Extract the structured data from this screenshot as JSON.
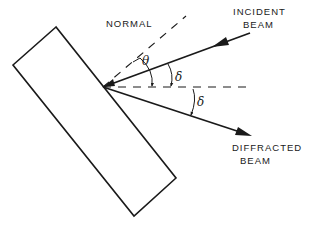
{
  "diagram": {
    "labels": {
      "normal": "NORMAL",
      "incident_line1": "INCIDENT",
      "incident_line2": "BEAM",
      "diffracted_line1": "DIFFRACTED",
      "diffracted_line2": "BEAM"
    },
    "angles": {
      "theta": "θ",
      "delta_upper": "δ",
      "delta_lower": "δ"
    },
    "elements": [
      {
        "name": "crystal",
        "shape": "rotated-rectangle"
      },
      {
        "name": "normal",
        "style": "dashed"
      },
      {
        "name": "incident-beam",
        "style": "solid-arrow",
        "direction": "toward crystal"
      },
      {
        "name": "reference-line",
        "style": "dashed-horizontal"
      },
      {
        "name": "diffracted-beam",
        "style": "solid-arrow",
        "direction": "away from crystal"
      }
    ],
    "colors": {
      "stroke": "#1a1a1a",
      "background": "#ffffff"
    }
  }
}
